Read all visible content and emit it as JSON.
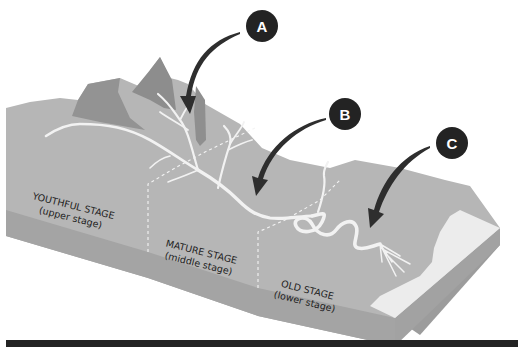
{
  "diagram": {
    "stages": [
      {
        "name": "YOUTHFUL STAGE",
        "sub": "(upper stage)"
      },
      {
        "name": "MATURE STAGE",
        "sub": "(middle stage)"
      },
      {
        "name": "OLD STAGE",
        "sub": "(lower stage)"
      }
    ],
    "callouts": [
      {
        "letter": "A"
      },
      {
        "letter": "B"
      },
      {
        "letter": "C"
      }
    ],
    "colors": {
      "surface": "#b4b4b4",
      "front_face": "#a6a6a6",
      "mountain_dark": "#8f8f8f",
      "river": "#f1f1f1",
      "sea": "#ececec",
      "callout": "#232323",
      "arrow": "#2e2e2e",
      "footer_bar": "#232323"
    }
  }
}
